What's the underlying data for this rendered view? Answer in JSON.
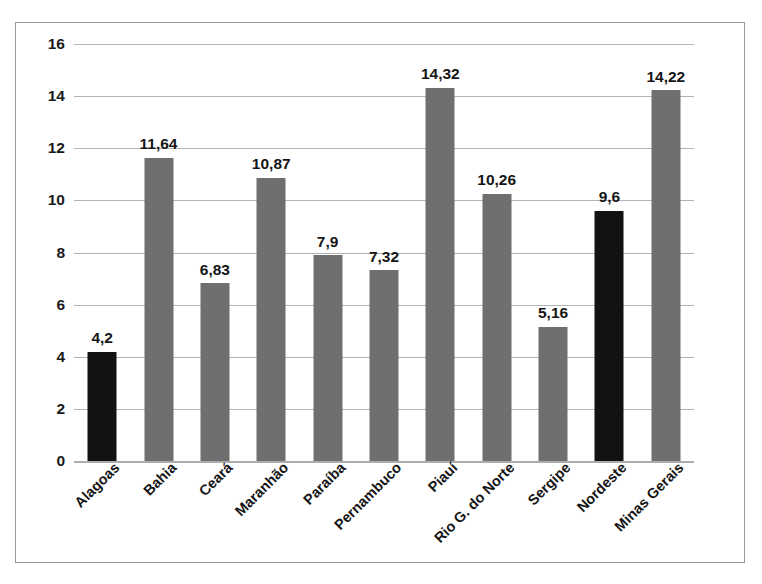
{
  "chart_data": {
    "type": "bar",
    "title": "",
    "subtitle": "",
    "xlabel": "",
    "ylabel": "",
    "ylim": [
      0,
      16
    ],
    "ytick_step": 2,
    "ytick_labels": [
      "16",
      "14",
      "12",
      "10",
      "8",
      "6",
      "4",
      "2",
      "0"
    ],
    "ytick_values": [
      16,
      14,
      12,
      10,
      8,
      6,
      4,
      2,
      0
    ],
    "grid": true,
    "legend": "none",
    "decimal_separator": ",",
    "categories": [
      "Alagoas",
      "Bahia",
      "Ceará",
      "Maranhão",
      "Paraíba",
      "Pernambuco",
      "Piauí",
      "Rio G. do Norte",
      "Sergipe",
      "Nordeste",
      "Minas Gerais"
    ],
    "values": [
      4.2,
      11.64,
      6.83,
      10.87,
      7.9,
      7.32,
      14.32,
      10.26,
      5.16,
      9.6,
      14.22
    ],
    "value_labels": [
      "4,2",
      "11,64",
      "6,83",
      "10,87",
      "7,9",
      "7,32",
      "14,32",
      "10,26",
      "5,16",
      "9,6",
      "14,22"
    ],
    "bar_colors": [
      "#121212",
      "#6f6f6f",
      "#6f6f6f",
      "#6f6f6f",
      "#6f6f6f",
      "#6f6f6f",
      "#6f6f6f",
      "#6f6f6f",
      "#6f6f6f",
      "#121212",
      "#6f6f6f"
    ],
    "highlight_color": "#121212",
    "series_color": "#6f6f6f",
    "gridline_color": "#b3b3b3",
    "frame_color": "#9a9a9a"
  }
}
